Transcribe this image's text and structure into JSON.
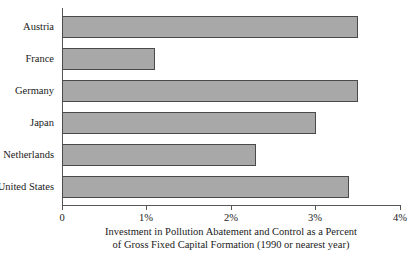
{
  "chart_data": {
    "type": "bar",
    "orientation": "horizontal",
    "title": "",
    "caption_line1": "Investment in Pollution Abatement and Control as a Percent",
    "caption_line2": "of Gross Fixed Capital Formation (1990 or nearest year)",
    "categories": [
      "Austria",
      "France",
      "Germany",
      "Japan",
      "Netherlands",
      "United States"
    ],
    "values": [
      3.5,
      1.1,
      3.5,
      3.0,
      2.3,
      3.4
    ],
    "xlabel": "",
    "ylabel": "",
    "xlim": [
      0,
      4
    ],
    "xticks": [
      0,
      1,
      2,
      3,
      4
    ],
    "xtick_labels": [
      "0",
      "1%",
      "2%",
      "3%",
      "4%"
    ],
    "grid": false,
    "legend": null,
    "units": "percent",
    "bar_fill_color": "#a8a8a8",
    "bar_edge_color": "#4a4a4a",
    "axis_color": "#555555"
  }
}
